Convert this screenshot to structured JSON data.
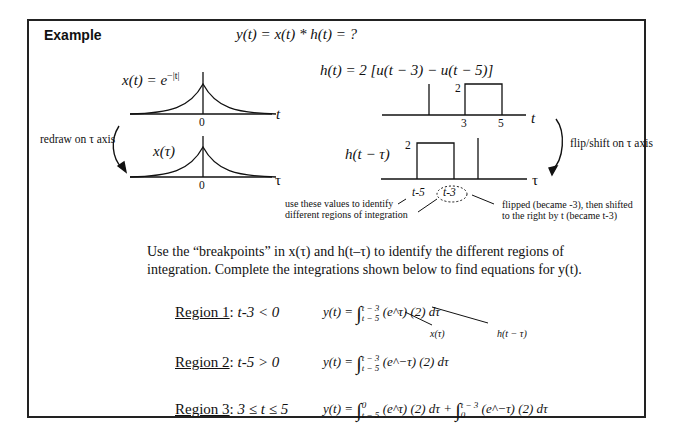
{
  "header": {
    "title": "Example",
    "main_equation": "y(t) = x(t) * h(t) = ?"
  },
  "x_plot": {
    "label_lhs": "x(t) = e",
    "label_exp": "−|t|",
    "axis_label": "t",
    "origin_tick": "0"
  },
  "x_tau_plot": {
    "label": "x(τ)",
    "axis_label": "τ",
    "origin_tick": "0"
  },
  "h_plot": {
    "label": "h(t) = 2 [u(t − 3) − u(t − 5)]",
    "height_label": "2",
    "tick_3": "3",
    "tick_5": "5",
    "axis_label": "t"
  },
  "h_flip_plot": {
    "label": "h(t − τ)",
    "height_label": "2",
    "tick_left": "t-5",
    "tick_right": "t-3",
    "axis_label": "τ"
  },
  "annotations": {
    "redraw": "redraw on τ axis",
    "flip_shift": "flip/shift on τ axis",
    "use_values_line1": "use these values to identify",
    "use_values_line2": "different regions of integration",
    "flipped_line1": "flipped (became -3), then shifted",
    "flipped_line2": "to the right by t (became t-3)"
  },
  "instructions": {
    "line1": "Use the “breakpoints” in x(τ) and h(t–τ) to identify the different regions of",
    "line2": "integration. Complete the integrations shown below to find equations for y(t)."
  },
  "regions": [
    {
      "name": "Region 1",
      "condition": "t-3 < 0",
      "lhs": "y(t) =",
      "upper": "t − 3",
      "lower": "t − 5",
      "integrand": "(e^τ) (2) dτ",
      "note_x": "x(τ)",
      "note_h": "h(t − τ)"
    },
    {
      "name": "Region 2",
      "condition": "t-5 > 0",
      "lhs": "y(t) =",
      "upper": "t − 3",
      "lower": "t − 5",
      "integrand": "(e^−τ) (2) dτ"
    },
    {
      "name": "Region 3",
      "condition": "3 ≤ t ≤ 5",
      "lhs": "y(t) =",
      "upper1": "0",
      "lower1": "t − 5",
      "integrand1": "(e^τ) (2) dτ +",
      "upper2": "t − 3",
      "lower2": "0",
      "integrand2": "(e^−τ) (2) dτ"
    }
  ]
}
